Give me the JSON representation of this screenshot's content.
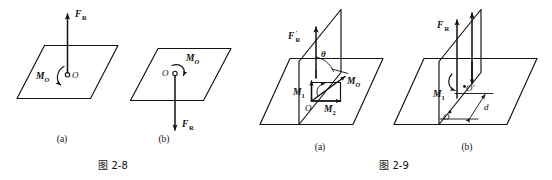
{
  "document": {
    "kind": "textbook-figure-pair",
    "background_color": "#ffffff",
    "ink_color": "#111111"
  },
  "figures": [
    {
      "id": "fig-2-8",
      "caption": "图 2-8",
      "caption_number": "2-8",
      "panels": [
        {
          "id": "fig-2-8-a",
          "sublabel": "(a)",
          "description_labels": {
            "force": "F",
            "force_sub": "R",
            "moment": "M",
            "moment_sub": "O",
            "point": "O"
          },
          "force_direction": "up",
          "moment_sense": "counterclockwise"
        },
        {
          "id": "fig-2-8-b",
          "sublabel": "(b)",
          "description_labels": {
            "force": "F",
            "force_sub": "R",
            "moment": "M",
            "moment_sub": "O",
            "point": "O"
          },
          "force_direction": "down",
          "moment_sense": "clockwise"
        }
      ]
    },
    {
      "id": "fig-2-9",
      "caption": "图 2-9",
      "caption_number": "2-9",
      "panels": [
        {
          "id": "fig-2-9-a",
          "sublabel": "(a)",
          "description_labels": {
            "force": "F",
            "force_sub": "R",
            "force_prime": "′",
            "moment_resultant": "M",
            "moment_resultant_sub": "O",
            "moment_1": "M",
            "moment_1_sub": "1",
            "moment_2": "M",
            "moment_2_sub": "2",
            "angle": "θ",
            "point": "O"
          },
          "force_direction": "up"
        },
        {
          "id": "fig-2-9-b",
          "sublabel": "(b)",
          "description_labels": {
            "force": "F",
            "force_sub": "R",
            "moment_1": "M",
            "moment_1_sub": "1",
            "point": "O",
            "point_prime": "O′",
            "distance": "d"
          },
          "force_direction": "up"
        }
      ]
    }
  ]
}
